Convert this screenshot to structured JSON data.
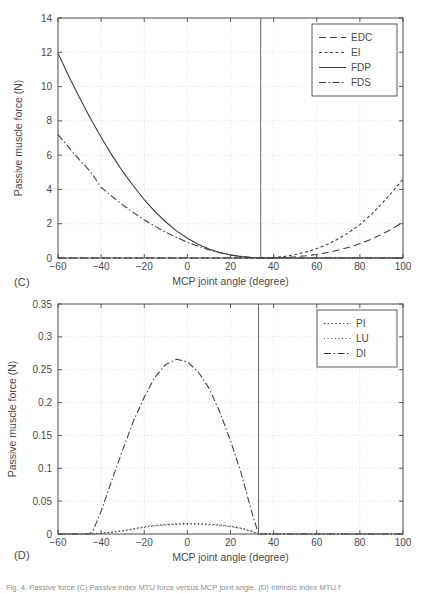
{
  "figure": {
    "panel_c_label": "(C)",
    "panel_d_label": "(D)",
    "caption": "Fig. 4. Passive force (C) Passive index MTU force versus MCP joint angle. (D) Intrinsic index MTU f"
  },
  "chart_data": [
    {
      "id": "panel-c",
      "type": "line",
      "title": "",
      "xlabel": "MCP joint angle (degree)",
      "ylabel": "Passive muscle force (N)",
      "xlim": [
        -60,
        100
      ],
      "ylim": [
        0,
        14
      ],
      "xticks": [
        -60,
        -40,
        -20,
        0,
        20,
        40,
        60,
        80,
        100
      ],
      "xtick_labels": [
        "−60",
        "−40",
        "−20",
        "0",
        "20",
        "40",
        "60",
        "80",
        "100"
      ],
      "yticks": [
        0,
        2,
        4,
        6,
        8,
        10,
        12,
        14
      ],
      "ytick_labels": [
        "0",
        "2",
        "4",
        "6",
        "8",
        "10",
        "12",
        "14"
      ],
      "grid": true,
      "legend_position": "upper right",
      "vline_x": 34,
      "series": [
        {
          "name": "EDC",
          "style": "dashed",
          "x": [
            -60,
            -50,
            -40,
            -30,
            -20,
            -10,
            0,
            10,
            20,
            30,
            34,
            40,
            45,
            50,
            55,
            60,
            65,
            70,
            75,
            80,
            85,
            90,
            95,
            100
          ],
          "y": [
            0,
            0,
            0,
            0,
            0,
            0,
            0,
            0,
            0,
            0,
            0,
            0.01,
            0.03,
            0.07,
            0.13,
            0.21,
            0.32,
            0.46,
            0.63,
            0.84,
            1.08,
            1.37,
            1.7,
            2.1
          ]
        },
        {
          "name": "EI",
          "style": "dotted-dash",
          "x": [
            -60,
            -50,
            -40,
            -30,
            -20,
            -10,
            0,
            10,
            20,
            30,
            34,
            40,
            45,
            50,
            55,
            60,
            65,
            70,
            75,
            80,
            85,
            90,
            95,
            100
          ],
          "y": [
            0,
            0,
            0,
            0,
            0,
            0,
            0,
            0,
            0,
            0,
            0,
            0.03,
            0.09,
            0.2,
            0.35,
            0.55,
            0.8,
            1.12,
            1.5,
            1.95,
            2.5,
            3.15,
            3.85,
            4.6
          ]
        },
        {
          "name": "FDP",
          "style": "solid",
          "x": [
            -60,
            -55,
            -50,
            -45,
            -40,
            -35,
            -30,
            -25,
            -20,
            -15,
            -10,
            -5,
            0,
            5,
            10,
            15,
            20,
            25,
            30,
            34,
            40,
            60,
            80,
            100
          ],
          "y": [
            11.95,
            10.6,
            9.35,
            8.15,
            7.05,
            6.0,
            5.05,
            4.2,
            3.4,
            2.7,
            2.1,
            1.58,
            1.15,
            0.8,
            0.53,
            0.32,
            0.18,
            0.08,
            0.02,
            0,
            0,
            0,
            0,
            0
          ]
        },
        {
          "name": "FDS",
          "style": "dash-dot",
          "x": [
            -60,
            -55,
            -50,
            -45,
            -40,
            -35,
            -30,
            -25,
            -20,
            -15,
            -10,
            -5,
            0,
            5,
            10,
            15,
            20,
            25,
            30,
            34,
            40,
            60,
            80,
            100
          ],
          "y": [
            7.2,
            6.45,
            5.72,
            5.05,
            4.12,
            3.6,
            3.1,
            2.65,
            2.22,
            1.85,
            1.5,
            1.2,
            0.92,
            0.68,
            0.48,
            0.31,
            0.18,
            0.09,
            0.03,
            0,
            0,
            0,
            0,
            0
          ]
        }
      ]
    },
    {
      "id": "panel-d",
      "type": "line",
      "title": "",
      "xlabel": "MCP joint angle (degree)",
      "ylabel": "Passive muscle force (N)",
      "xlim": [
        -60,
        100
      ],
      "ylim": [
        0,
        0.35
      ],
      "xticks": [
        -60,
        -40,
        -20,
        0,
        20,
        40,
        60,
        80,
        100
      ],
      "xtick_labels": [
        "−60",
        "−40",
        "−20",
        "0",
        "20",
        "40",
        "60",
        "80",
        "100"
      ],
      "yticks": [
        0,
        0.05,
        0.1,
        0.15,
        0.2,
        0.25,
        0.3,
        0.35
      ],
      "ytick_labels": [
        "0",
        "0.05",
        "0.1",
        "0.15",
        "0.2",
        "0.25",
        "0.3",
        "0.35"
      ],
      "grid": true,
      "legend_position": "upper right",
      "vline_x": 33,
      "series": [
        {
          "name": "PI",
          "style": "dotted",
          "x": [
            -60,
            -45,
            -40,
            -35,
            -30,
            -25,
            -20,
            -15,
            -10,
            -5,
            0,
            5,
            10,
            15,
            20,
            25,
            30,
            33,
            40,
            60,
            80,
            100
          ],
          "y": [
            0,
            0,
            0.001,
            0.003,
            0.005,
            0.008,
            0.011,
            0.013,
            0.0145,
            0.0155,
            0.016,
            0.0158,
            0.015,
            0.0138,
            0.0118,
            0.009,
            0.004,
            0,
            0,
            0,
            0,
            0
          ]
        },
        {
          "name": "LU",
          "style": "dotted-fine",
          "x": [
            -60,
            -45,
            -40,
            -35,
            -30,
            -25,
            -20,
            -15,
            -10,
            -5,
            0,
            5,
            10,
            15,
            20,
            25,
            30,
            33,
            40,
            60,
            80,
            100
          ],
          "y": [
            0,
            0,
            0.0008,
            0.0025,
            0.0045,
            0.0072,
            0.01,
            0.0122,
            0.0136,
            0.0146,
            0.015,
            0.0148,
            0.0141,
            0.0129,
            0.011,
            0.0083,
            0.0036,
            0,
            0,
            0,
            0,
            0
          ]
        },
        {
          "name": "DI",
          "style": "dash-dot",
          "x": [
            -60,
            -46,
            -44,
            -40,
            -35,
            -30,
            -25,
            -20,
            -15,
            -10,
            -5,
            0,
            5,
            10,
            15,
            20,
            25,
            30,
            33,
            40,
            60,
            80,
            100
          ],
          "y": [
            0,
            0,
            0.003,
            0.035,
            0.082,
            0.128,
            0.172,
            0.208,
            0.239,
            0.258,
            0.266,
            0.262,
            0.247,
            0.222,
            0.186,
            0.142,
            0.092,
            0.032,
            0,
            0,
            0,
            0,
            0
          ]
        }
      ]
    }
  ]
}
